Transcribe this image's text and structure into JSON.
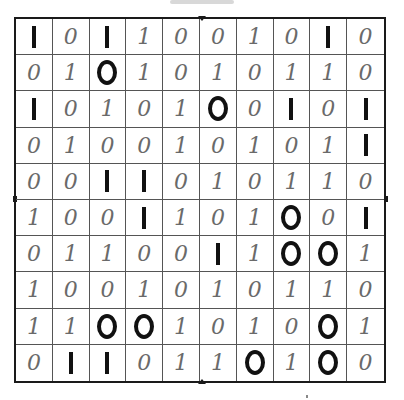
{
  "puzzle": {
    "type": "binary-takuzu",
    "size": 10,
    "rows": [
      [
        {
          "v": "1",
          "given": true
        },
        {
          "v": "0",
          "given": false
        },
        {
          "v": "1",
          "given": true
        },
        {
          "v": "1",
          "given": false
        },
        {
          "v": "0",
          "given": false
        },
        {
          "v": "0",
          "given": false
        },
        {
          "v": "1",
          "given": false
        },
        {
          "v": "0",
          "given": false
        },
        {
          "v": "1",
          "given": true
        },
        {
          "v": "0",
          "given": false
        }
      ],
      [
        {
          "v": "0",
          "given": false
        },
        {
          "v": "1",
          "given": false
        },
        {
          "v": "0",
          "given": true
        },
        {
          "v": "1",
          "given": false
        },
        {
          "v": "0",
          "given": false
        },
        {
          "v": "1",
          "given": false
        },
        {
          "v": "0",
          "given": false
        },
        {
          "v": "1",
          "given": false
        },
        {
          "v": "1",
          "given": false
        },
        {
          "v": "0",
          "given": false
        }
      ],
      [
        {
          "v": "1",
          "given": true
        },
        {
          "v": "0",
          "given": false
        },
        {
          "v": "1",
          "given": false
        },
        {
          "v": "0",
          "given": false
        },
        {
          "v": "1",
          "given": false
        },
        {
          "v": "0",
          "given": true
        },
        {
          "v": "0",
          "given": false
        },
        {
          "v": "1",
          "given": true
        },
        {
          "v": "0",
          "given": false
        },
        {
          "v": "1",
          "given": true
        }
      ],
      [
        {
          "v": "0",
          "given": false
        },
        {
          "v": "1",
          "given": false
        },
        {
          "v": "0",
          "given": false
        },
        {
          "v": "0",
          "given": false
        },
        {
          "v": "1",
          "given": false
        },
        {
          "v": "0",
          "given": false
        },
        {
          "v": "1",
          "given": false
        },
        {
          "v": "0",
          "given": false
        },
        {
          "v": "1",
          "given": false
        },
        {
          "v": "1",
          "given": true
        }
      ],
      [
        {
          "v": "0",
          "given": false
        },
        {
          "v": "0",
          "given": false
        },
        {
          "v": "1",
          "given": true
        },
        {
          "v": "1",
          "given": true
        },
        {
          "v": "0",
          "given": false
        },
        {
          "v": "1",
          "given": false
        },
        {
          "v": "0",
          "given": false
        },
        {
          "v": "1",
          "given": false
        },
        {
          "v": "1",
          "given": false
        },
        {
          "v": "0",
          "given": false
        }
      ],
      [
        {
          "v": "1",
          "given": false
        },
        {
          "v": "0",
          "given": false
        },
        {
          "v": "0",
          "given": false
        },
        {
          "v": "1",
          "given": true
        },
        {
          "v": "1",
          "given": false
        },
        {
          "v": "0",
          "given": false
        },
        {
          "v": "1",
          "given": false
        },
        {
          "v": "0",
          "given": true
        },
        {
          "v": "0",
          "given": false
        },
        {
          "v": "1",
          "given": true
        }
      ],
      [
        {
          "v": "0",
          "given": false
        },
        {
          "v": "1",
          "given": false
        },
        {
          "v": "1",
          "given": false
        },
        {
          "v": "0",
          "given": false
        },
        {
          "v": "0",
          "given": false
        },
        {
          "v": "1",
          "given": true
        },
        {
          "v": "1",
          "given": false
        },
        {
          "v": "0",
          "given": true
        },
        {
          "v": "0",
          "given": true
        },
        {
          "v": "1",
          "given": false
        }
      ],
      [
        {
          "v": "1",
          "given": false
        },
        {
          "v": "0",
          "given": false
        },
        {
          "v": "0",
          "given": false
        },
        {
          "v": "1",
          "given": false
        },
        {
          "v": "0",
          "given": false
        },
        {
          "v": "1",
          "given": false
        },
        {
          "v": "0",
          "given": false
        },
        {
          "v": "1",
          "given": false
        },
        {
          "v": "1",
          "given": false
        },
        {
          "v": "0",
          "given": false
        }
      ],
      [
        {
          "v": "1",
          "given": false
        },
        {
          "v": "1",
          "given": false
        },
        {
          "v": "0",
          "given": true
        },
        {
          "v": "0",
          "given": true
        },
        {
          "v": "1",
          "given": false
        },
        {
          "v": "0",
          "given": false
        },
        {
          "v": "1",
          "given": false
        },
        {
          "v": "0",
          "given": false
        },
        {
          "v": "0",
          "given": true
        },
        {
          "v": "1",
          "given": false
        }
      ],
      [
        {
          "v": "0",
          "given": false
        },
        {
          "v": "1",
          "given": true
        },
        {
          "v": "1",
          "given": true
        },
        {
          "v": "0",
          "given": false
        },
        {
          "v": "1",
          "given": false
        },
        {
          "v": "1",
          "given": false
        },
        {
          "v": "0",
          "given": true
        },
        {
          "v": "1",
          "given": false
        },
        {
          "v": "0",
          "given": true
        },
        {
          "v": "0",
          "given": false
        }
      ]
    ]
  },
  "colors": {
    "given_ink": "#111111",
    "pencil_ink": "#6a6a6a",
    "grid_line": "#555555",
    "border": "#1a1a1a",
    "background": "#ffffff"
  }
}
